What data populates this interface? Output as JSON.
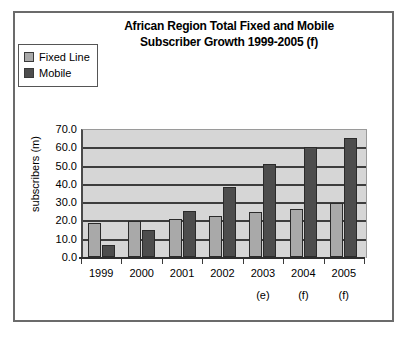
{
  "chart_data": {
    "type": "bar",
    "title": "African Region Total Fixed and Mobile Subscriber Growth 1999-2005 (f)",
    "title_lines": [
      "African Region Total Fixed and Mobile",
      "Subscriber Growth 1999-2005 (f)"
    ],
    "xlabel": "",
    "ylabel": "subscribers (m)",
    "ylim": [
      0.0,
      70.0
    ],
    "ytick_step": 10.0,
    "ytick_labels": [
      "70.0",
      "60.0",
      "50.0",
      "40.0",
      "30.0",
      "20.0",
      "10.0",
      "0.0"
    ],
    "ytick_values": [
      70.0,
      60.0,
      50.0,
      40.0,
      30.0,
      20.0,
      10.0,
      0.0
    ],
    "grid": true,
    "grid_axis": "y",
    "legend_position": "top-left",
    "categories": [
      "1999",
      "2000",
      "2001",
      "2002",
      "2003",
      "2004",
      "2005"
    ],
    "category_notes": [
      "",
      "",
      "",
      "",
      "(e)",
      "(f)",
      "(f)"
    ],
    "series": [
      {
        "name": "Fixed Line",
        "color": "#a9a9a9",
        "values": [
          18.5,
          19.5,
          21.0,
          22.5,
          24.5,
          26.5,
          29.5
        ]
      },
      {
        "name": "Mobile",
        "color": "#4d4d4d",
        "values": [
          6.5,
          15.0,
          25.0,
          38.5,
          51.0,
          60.0,
          65.0
        ]
      }
    ]
  },
  "legend": {
    "items": [
      {
        "label": "Fixed Line",
        "color": "#a9a9a9"
      },
      {
        "label": "Mobile",
        "color": "#4d4d4d"
      }
    ]
  },
  "colors": {
    "plot_background": "#d6d6d6",
    "gridline": "#3d3d3d",
    "frame_border": "#6b6b6b",
    "page_background": "#ffffff",
    "text": "#000000"
  }
}
